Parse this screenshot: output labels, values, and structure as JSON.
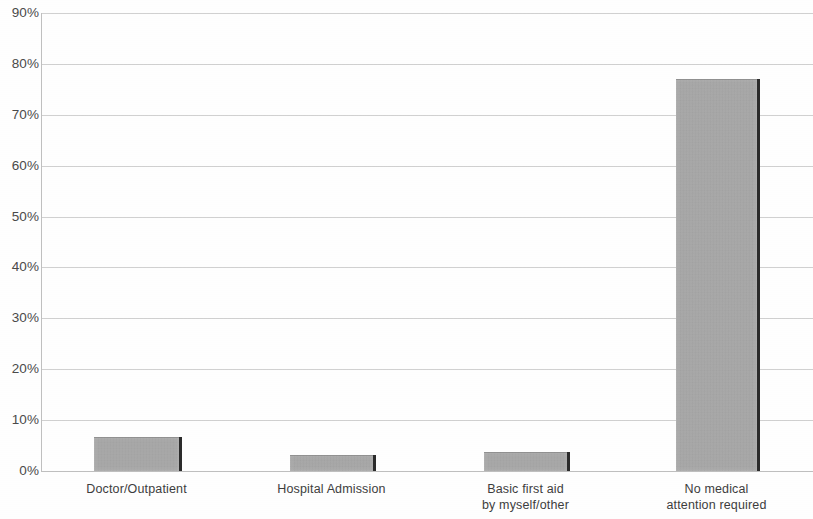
{
  "chart_data": {
    "type": "bar",
    "title": "",
    "xlabel": "",
    "ylabel": "",
    "categories": [
      "Doctor/Outpatient",
      "Hospital Admission",
      "Basic first aid by myself/other",
      "No medical attention required"
    ],
    "category_lines": [
      [
        "Doctor/Outpatient"
      ],
      [
        "Hospital Admission"
      ],
      [
        "Basic first aid",
        "by myself/other"
      ],
      [
        "No medical",
        "attention required"
      ]
    ],
    "values": [
      6.7,
      3.1,
      3.8,
      77.0
    ],
    "value_labels": [
      "6.7%",
      "3.1%",
      "3.8%",
      "77.0%"
    ],
    "ylim": [
      0,
      90
    ],
    "ytick_labels": [
      "90%",
      "80%",
      "70%",
      "60%",
      "50%",
      "40%",
      "30%",
      "20%",
      "10%",
      "0%"
    ],
    "ytick_values": [
      90,
      80,
      70,
      60,
      50,
      40,
      30,
      20,
      10,
      0
    ],
    "grid": true,
    "legend": false,
    "bar_color": "#a9a9a9",
    "bar_edge_color": "#2b2b2b",
    "gridline_color": "#c9c9c9",
    "axis_color": "#c0c0c0",
    "text_color": "#3d3d3d",
    "background": "#ffffff"
  }
}
